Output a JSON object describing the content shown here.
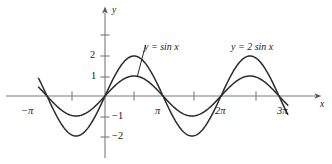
{
  "figure": {
    "title": "",
    "background": "#ffffff",
    "curve_color": "#2b2b2b",
    "axis_color": "#7a7a7a",
    "text_color": "#1a1a1a"
  },
  "axes": {
    "x_axis_label": "x",
    "y_axis_label": "y",
    "x_tick_labels": [
      {
        "text": "−π",
        "x": -3.14159
      },
      {
        "text": "π",
        "x": 3.14159
      },
      {
        "text": "2π",
        "x": 6.28319
      },
      {
        "text": "3π",
        "x": 9.42478
      }
    ],
    "y_tick_labels": [
      {
        "text": "2",
        "y": 2
      },
      {
        "text": "1",
        "y": 1
      },
      {
        "text": "−1",
        "y": -1
      },
      {
        "text": "−2",
        "y": -2
      }
    ],
    "x_minor_ticks": [
      -1.5708,
      1.5708,
      4.71239,
      7.85398
    ],
    "y_minor_ticks": [
      3
    ],
    "xlim": [
      -4.2,
      11.3
    ],
    "ylim": [
      -3.4,
      3.6
    ],
    "grid": false
  },
  "chart_data": {
    "type": "line",
    "title": "",
    "xlabel": "x",
    "ylabel": "y",
    "xlim": [
      -4.2,
      11.3
    ],
    "ylim": [
      -3.4,
      3.6
    ],
    "grid": false,
    "legend_position": "inline-annotations",
    "x_unit": "pi",
    "series": [
      {
        "name": "y = sin x",
        "label": "y = sin x",
        "amplitude": 1,
        "period": 6.28319,
        "formula": "sin(x)",
        "domain": [
          -3.6,
          9.9
        ],
        "key_points": [
          {
            "x": -3.14159,
            "y": 0
          },
          {
            "x": -1.5708,
            "y": -1
          },
          {
            "x": 0,
            "y": 0
          },
          {
            "x": 1.5708,
            "y": 1
          },
          {
            "x": 3.14159,
            "y": 0
          },
          {
            "x": 4.71239,
            "y": -1
          },
          {
            "x": 6.28319,
            "y": 0
          },
          {
            "x": 7.85398,
            "y": 1
          },
          {
            "x": 9.42478,
            "y": 0
          }
        ]
      },
      {
        "name": "y = 2 sin x",
        "label": "y = 2 sin x",
        "amplitude": 2,
        "period": 6.28319,
        "formula": "2*sin(x)",
        "domain": [
          -3.6,
          9.9
        ],
        "key_points": [
          {
            "x": -3.14159,
            "y": 0
          },
          {
            "x": -1.5708,
            "y": -2
          },
          {
            "x": 0,
            "y": 0
          },
          {
            "x": 1.5708,
            "y": 2
          },
          {
            "x": 3.14159,
            "y": 0
          },
          {
            "x": 4.71239,
            "y": -2
          },
          {
            "x": 6.28319,
            "y": 0
          },
          {
            "x": 7.85398,
            "y": 2
          },
          {
            "x": 9.42478,
            "y": 0
          }
        ]
      }
    ],
    "annotations": [
      {
        "text": "y = sin x",
        "target_series": "y = sin x",
        "has_leader_line": true,
        "leader_from": {
          "x": 2.2,
          "y": 2.55
        },
        "leader_to": {
          "x": 1.75,
          "y": 0.98
        }
      },
      {
        "text": "y = 2 sin x",
        "target_series": "y = 2 sin x",
        "has_leader_line": false
      }
    ]
  }
}
